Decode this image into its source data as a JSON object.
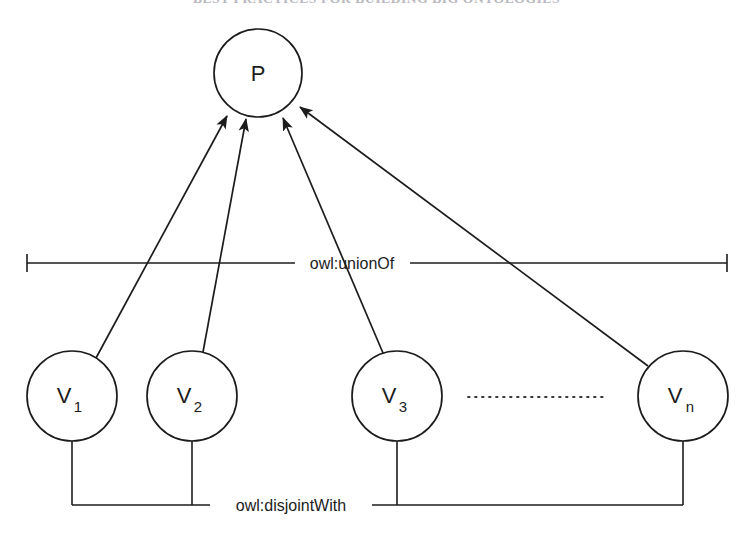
{
  "page": {
    "header_text": "BEST PRACTICES FOR BUILDING BIG ONTOLOGIES",
    "background_color": "#ffffff",
    "ink_color": "#1c1c1c",
    "width": 753,
    "height": 544
  },
  "diagram": {
    "type": "owl-class-axiom-diagram",
    "parent_node": {
      "id": "P",
      "label": "P",
      "subscript": "",
      "cx": 258,
      "cy": 73,
      "r": 44
    },
    "child_nodes": [
      {
        "id": "V1",
        "label": "V",
        "subscript": "1",
        "cx": 72,
        "cy": 396,
        "r": 45
      },
      {
        "id": "V2",
        "label": "V",
        "subscript": "2",
        "cx": 192,
        "cy": 396,
        "r": 45
      },
      {
        "id": "V3",
        "label": "V",
        "subscript": "3",
        "cx": 397,
        "cy": 396,
        "r": 45
      },
      {
        "id": "Vn",
        "label": "V",
        "subscript": "n",
        "cx": 683,
        "cy": 396,
        "r": 45
      }
    ],
    "ellipsis": {
      "name": "continuation-dots",
      "x1": 466,
      "x2": 605,
      "y": 397
    },
    "union_relation": {
      "label": "owl:unionOf",
      "line_y": 263,
      "left_x": 27,
      "right_x": 727,
      "label_center_x": 352,
      "cap_height": 18
    },
    "disjoint_relation": {
      "label": "owl:disjointWith",
      "line_y": 505,
      "left_x": 72,
      "right_x": 683,
      "label_center_x": 290,
      "connector_tops": [
        443,
        443,
        443,
        443
      ]
    },
    "arrows": [
      {
        "name": "arrow-v1-to-p",
        "from": "V1",
        "to": "P"
      },
      {
        "name": "arrow-v2-to-p",
        "from": "V2",
        "to": "P"
      },
      {
        "name": "arrow-v3-to-p",
        "from": "V3",
        "to": "P"
      },
      {
        "name": "arrow-vn-to-p",
        "from": "Vn",
        "to": "P"
      }
    ]
  }
}
